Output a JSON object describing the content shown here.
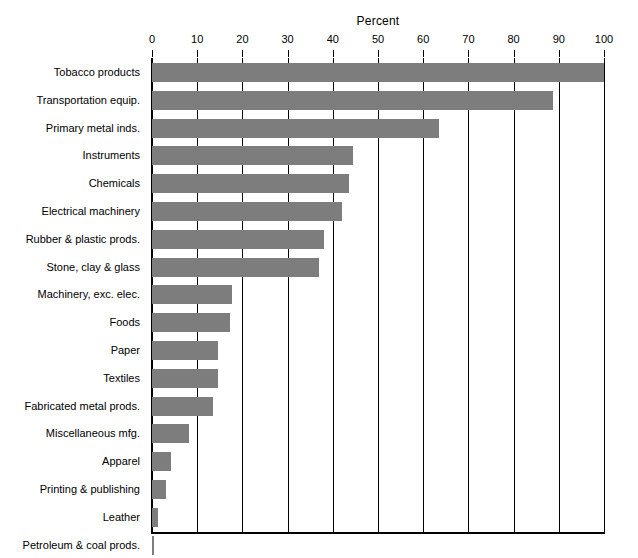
{
  "chart_data": {
    "type": "bar",
    "orientation": "horizontal",
    "title": "Percent",
    "xlabel": "Percent",
    "ylabel": "",
    "xlim": [
      0,
      100
    ],
    "grid": true,
    "legend": false,
    "bar_color": "#7d7d7d",
    "axis_color": "#000000",
    "background": "#ffffff",
    "tick_labels": [
      "0",
      "10",
      "20",
      "30",
      "40",
      "50",
      "60",
      "70",
      "80",
      "90",
      "100"
    ],
    "ticks": [
      0,
      10,
      20,
      30,
      40,
      50,
      60,
      70,
      80,
      90,
      100
    ],
    "categories": [
      "Tobacco products",
      "Transportation equip.",
      "Primary metal inds.",
      "Instruments",
      "Chemicals",
      "Electrical machinery",
      "Rubber & plastic prods.",
      "Stone, clay & glass",
      "Machinery, exc. elec.",
      "Foods",
      "Paper",
      "Textiles",
      "Fabricated metal prods.",
      "Miscellaneous mfg.",
      "Apparel",
      "Printing & publishing",
      "Leather",
      "Petroleum & coal prods."
    ],
    "values": [
      100.0,
      88.7,
      63.5,
      44.5,
      43.5,
      42.0,
      38.0,
      37.0,
      17.8,
      17.2,
      14.5,
      14.7,
      13.6,
      8.2,
      4.3,
      3.0,
      1.4,
      0.4
    ]
  }
}
